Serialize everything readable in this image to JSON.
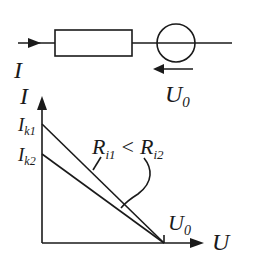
{
  "circuit": {
    "current_label": "I",
    "source_voltage_label": "U",
    "source_voltage_sub": "0"
  },
  "graph": {
    "y_axis_label": "I",
    "x_axis_label": "U",
    "y_ticks": [
      {
        "main": "I",
        "sub": "k1"
      },
      {
        "main": "I",
        "sub": "k2"
      }
    ],
    "x_tick": {
      "main": "U",
      "sub": "0"
    },
    "annotation": {
      "left_main": "R",
      "left_sub": "i1",
      "relation": "<",
      "right_main": "R",
      "right_sub": "i2"
    }
  },
  "colors": {
    "ink": "#1a1a1a",
    "background": "#ffffff"
  }
}
